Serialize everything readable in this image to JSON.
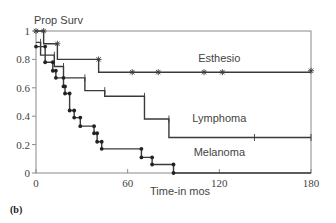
{
  "panel_label": "(b)",
  "chart_data": {
    "type": "line",
    "subtype": "kaplan-meier-step",
    "title": "",
    "ylabel": "Prop Surv",
    "xlabel": "Time-in mos",
    "xlim": [
      0,
      180
    ],
    "ylim": [
      0,
      1
    ],
    "x_ticks": [
      0,
      60,
      120,
      180
    ],
    "y_ticks": [
      0,
      0.2,
      0.4,
      0.6,
      0.8,
      1
    ],
    "y_tick_labels": [
      "0",
      "0.2",
      "0.4",
      "0.6",
      "0.8",
      "1"
    ],
    "grid": false,
    "legend": "inline labels",
    "series": [
      {
        "name": "Esthesio",
        "marker": "star",
        "label_pos": [
          120,
          0.78
        ],
        "steps": [
          [
            0,
            1.0
          ],
          [
            5,
            0.91
          ],
          [
            14,
            0.8
          ],
          [
            41,
            0.71
          ],
          [
            180,
            0.71
          ]
        ],
        "censored": [
          [
            0,
            1.0
          ],
          [
            5,
            1.0
          ],
          [
            14,
            0.91
          ],
          [
            41,
            0.8
          ],
          [
            63,
            0.71
          ],
          [
            80,
            0.71
          ],
          [
            110,
            0.71
          ],
          [
            122,
            0.71
          ],
          [
            180,
            0.72
          ]
        ]
      },
      {
        "name": "Lymphoma",
        "marker": "tick",
        "label_pos": [
          120,
          0.36
        ],
        "steps": [
          [
            0,
            0.92
          ],
          [
            3,
            0.83
          ],
          [
            12,
            0.75
          ],
          [
            18,
            0.67
          ],
          [
            32,
            0.58
          ],
          [
            45,
            0.54
          ],
          [
            71,
            0.38
          ],
          [
            87,
            0.25
          ],
          [
            180,
            0.25
          ]
        ],
        "censored": [
          [
            3,
            0.92
          ],
          [
            12,
            0.83
          ],
          [
            18,
            0.75
          ],
          [
            32,
            0.67
          ],
          [
            45,
            0.58
          ],
          [
            71,
            0.54
          ],
          [
            87,
            0.38
          ],
          [
            143,
            0.25
          ],
          [
            180,
            0.25
          ]
        ]
      },
      {
        "name": "Melanoma",
        "marker": "dot",
        "label_pos": [
          120,
          0.12
        ],
        "steps": [
          [
            0,
            0.89
          ],
          [
            6,
            0.78
          ],
          [
            11,
            0.72
          ],
          [
            13,
            0.67
          ],
          [
            18,
            0.61
          ],
          [
            19,
            0.56
          ],
          [
            22,
            0.44
          ],
          [
            25,
            0.39
          ],
          [
            29,
            0.33
          ],
          [
            38,
            0.28
          ],
          [
            40,
            0.22
          ],
          [
            43,
            0.17
          ],
          [
            69,
            0.11
          ],
          [
            76,
            0.06
          ],
          [
            90,
            0.0
          ],
          [
            180,
            0.0
          ]
        ],
        "events": [
          [
            0,
            0.89
          ],
          [
            6,
            0.89
          ],
          [
            6,
            0.78
          ],
          [
            11,
            0.78
          ],
          [
            11,
            0.72
          ],
          [
            13,
            0.72
          ],
          [
            13,
            0.67
          ],
          [
            18,
            0.67
          ],
          [
            18,
            0.61
          ],
          [
            19,
            0.61
          ],
          [
            19,
            0.56
          ],
          [
            22,
            0.56
          ],
          [
            22,
            0.44
          ],
          [
            25,
            0.44
          ],
          [
            25,
            0.39
          ],
          [
            29,
            0.39
          ],
          [
            29,
            0.33
          ],
          [
            38,
            0.33
          ],
          [
            38,
            0.28
          ],
          [
            40,
            0.28
          ],
          [
            40,
            0.22
          ],
          [
            43,
            0.22
          ],
          [
            43,
            0.17
          ],
          [
            69,
            0.17
          ],
          [
            69,
            0.11
          ],
          [
            76,
            0.11
          ],
          [
            76,
            0.06
          ],
          [
            90,
            0.06
          ],
          [
            90,
            0.0
          ]
        ]
      }
    ],
    "annotations": []
  },
  "colors": {
    "axis": "#8a8a8a",
    "line": "#3a3a3a",
    "text": "#444444"
  }
}
